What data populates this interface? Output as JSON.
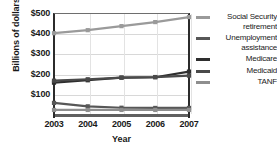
{
  "chart_data": {
    "type": "line",
    "title": "",
    "xlabel": "Year",
    "ylabel": "Billions of dollars",
    "categories": [
      "2003",
      "2004",
      "2005",
      "2006",
      "2007"
    ],
    "x": [
      2003,
      2004,
      2005,
      2006,
      2007
    ],
    "ylim": [
      0,
      500
    ],
    "ytick_values": [
      100,
      200,
      300,
      400,
      500
    ],
    "ytick_labels": [
      "$100",
      "$200",
      "$300",
      "$400",
      "$500"
    ],
    "grid": true,
    "legend_position": "right",
    "series": [
      {
        "name": "Social Security retirement",
        "color": "#9a9a9a",
        "values": [
          400,
          415,
          435,
          455,
          480
        ]
      },
      {
        "name": "Unemployment assistance",
        "color": "#575757",
        "values": [
          55,
          38,
          31,
          30,
          30
        ]
      },
      {
        "name": "Medicare",
        "color": "#2e2e2e",
        "values": [
          155,
          167,
          180,
          182,
          210
        ]
      },
      {
        "name": "Medicaid",
        "color": "#4a4a4a",
        "values": [
          165,
          172,
          180,
          183,
          190
        ]
      },
      {
        "name": "TANF",
        "color": "#8e8e8e",
        "values": [
          20,
          20,
          20,
          20,
          20
        ]
      }
    ]
  },
  "axes": {
    "ylabel": "Billions of dollars",
    "xlabel": "Year",
    "yticks": [
      {
        "label": "$500"
      },
      {
        "label": "$400"
      },
      {
        "label": "$300"
      },
      {
        "label": "$200"
      },
      {
        "label": "$100"
      }
    ],
    "xticks": [
      {
        "label": "2003"
      },
      {
        "label": "2004"
      },
      {
        "label": "2005"
      },
      {
        "label": "2006"
      },
      {
        "label": "2007"
      }
    ]
  },
  "legend": {
    "entries": [
      {
        "label": "Social Security retirement",
        "color": "#9a9a9a"
      },
      {
        "label": "Unemployment assistance",
        "color": "#575757"
      },
      {
        "label": "Medicare",
        "color": "#2e2e2e"
      },
      {
        "label": "Medicaid",
        "color": "#4a4a4a"
      },
      {
        "label": "TANF",
        "color": "#8e8e8e"
      }
    ]
  }
}
